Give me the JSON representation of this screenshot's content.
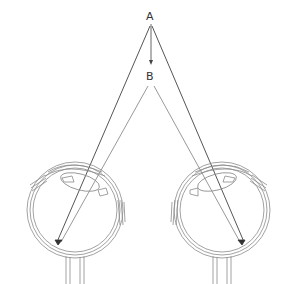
{
  "diagram": {
    "type": "binocular-vision-depth",
    "points": {
      "A": {
        "label": "A",
        "x": 150,
        "y": 16
      },
      "B": {
        "label": "B",
        "x": 150,
        "y": 76
      }
    },
    "eyes": [
      {
        "name": "left-eye",
        "cx": 75,
        "cy": 210,
        "r": 48
      },
      {
        "name": "right-eye",
        "cx": 222,
        "cy": 210,
        "r": 48
      }
    ],
    "colors": {
      "outline": "#8a8a8a",
      "ray_dark": "#555555",
      "ray_light": "#9a9a9a",
      "label": "#333333",
      "background": "#ffffff"
    }
  }
}
